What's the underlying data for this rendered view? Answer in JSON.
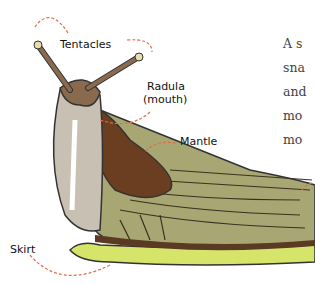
{
  "diagram": {
    "labels": {
      "tentacles": "Tentacles",
      "radula_line1": "Radula",
      "radula_line2": "(mouth)",
      "mantle": "Mantle",
      "skirt": "Skirt"
    },
    "colors": {
      "body_brown": "#8a6a4e",
      "mantle_dark": "#6b3e22",
      "shell_olive": "#a8a672",
      "foot_grey": "#c8c0b2",
      "skirt_green": "#d6e46a",
      "arrow": "#e0704a"
    }
  },
  "text": {
    "lines": [
      "A s",
      "sna",
      "and",
      "mo",
      "mo"
    ]
  }
}
